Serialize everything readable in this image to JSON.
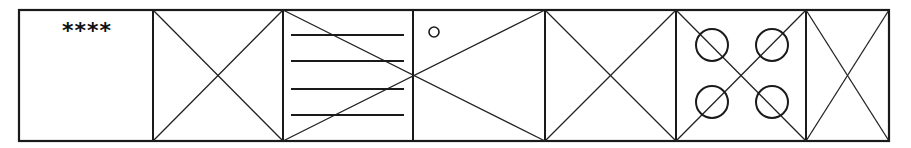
{
  "diagram": {
    "stroke_color": "#1a1a1a",
    "background": "#ffffff",
    "frame": {
      "left": 19,
      "top": 10,
      "right": 889,
      "bottom": 141
    },
    "dividers_x": [
      153,
      283,
      413,
      545,
      676,
      806
    ],
    "panels": [
      {
        "index": 1,
        "x0": 19,
        "x1": 153,
        "content": "text",
        "label": "****"
      },
      {
        "index": 2,
        "x0": 153,
        "x1": 283,
        "content": "x-cross"
      },
      {
        "index": 3,
        "x0": 283,
        "x1": 413,
        "content": "horizontal-lines",
        "line_count": 4,
        "lines_y": [
          35,
          61,
          89,
          115
        ],
        "line_x": [
          291,
          404
        ]
      },
      {
        "index": 4,
        "x0": 413,
        "x1": 545,
        "content": "small-circle",
        "circle": {
          "cx": 434,
          "cy": 32,
          "r": 5
        }
      },
      {
        "index": 5,
        "x0": 545,
        "x1": 676,
        "content": "x-cross"
      },
      {
        "index": 6,
        "x0": 676,
        "x1": 806,
        "content": "x-cross-with-circles",
        "circles": [
          {
            "cx": 712,
            "cy": 45,
            "r": 16
          },
          {
            "cx": 772,
            "cy": 45,
            "r": 16
          },
          {
            "cx": 712,
            "cy": 102,
            "r": 16
          },
          {
            "cx": 772,
            "cy": 102,
            "r": 16
          }
        ]
      },
      {
        "index": 7,
        "x0": 806,
        "x1": 889,
        "content": "x-cross"
      }
    ],
    "spanning_cross": {
      "x0": 283,
      "x1": 545,
      "note": "One X spans panels 3 and 4, crossing at the shared divider"
    }
  }
}
